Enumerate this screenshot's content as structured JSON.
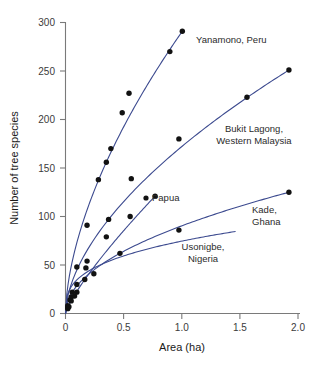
{
  "chart_data": {
    "type": "scatter",
    "title": "",
    "xlabel": "Area (ha)",
    "ylabel": "Number of tree species",
    "xlim": [
      0,
      2.05
    ],
    "ylim": [
      0,
      300
    ],
    "xticks": [
      0,
      0.5,
      1.0,
      1.5,
      2.0
    ],
    "xticklabels": [
      "0",
      "0.5",
      "1.0",
      "1.5",
      "2.0"
    ],
    "yticks": [
      0,
      50,
      100,
      150,
      200,
      250,
      300
    ],
    "yticklabels": [
      "0",
      "50",
      "100",
      "150",
      "200",
      "250",
      "300"
    ],
    "grid": false,
    "legend": "inline-annotations",
    "line_color": "#3c4a8f",
    "marker_color": "#121212",
    "series": [
      {
        "name": "Yanamono, Peru",
        "label": "Yanamono, Peru",
        "label_lines": [
          "Yanamono, Peru"
        ],
        "points": [
          {
            "x": 0.02,
            "y": 6
          },
          {
            "x": 0.04,
            "y": 14
          },
          {
            "x": 0.06,
            "y": 22
          },
          {
            "x": 0.1,
            "y": 48
          },
          {
            "x": 0.19,
            "y": 54
          },
          {
            "x": 0.29,
            "y": 138
          },
          {
            "x": 0.36,
            "y": 156
          },
          {
            "x": 0.4,
            "y": 170
          },
          {
            "x": 0.5,
            "y": 207
          },
          {
            "x": 0.56,
            "y": 227
          },
          {
            "x": 0.92,
            "y": 270
          },
          {
            "x": 1.03,
            "y": 291
          }
        ]
      },
      {
        "name": "Bukit Lagong, Western Malaysia",
        "label": "Bukit Lagong, Western Malaysia",
        "label_lines": [
          "Bukit Lagong,",
          "Western Malaysia"
        ],
        "points": [
          {
            "x": 0.02,
            "y": 8
          },
          {
            "x": 0.05,
            "y": 17
          },
          {
            "x": 0.1,
            "y": 30
          },
          {
            "x": 0.18,
            "y": 47
          },
          {
            "x": 0.19,
            "y": 91
          },
          {
            "x": 0.38,
            "y": 97
          },
          {
            "x": 0.58,
            "y": 139
          },
          {
            "x": 1.0,
            "y": 180
          },
          {
            "x": 1.6,
            "y": 223
          },
          {
            "x": 1.97,
            "y": 251
          }
        ]
      },
      {
        "name": "Papua",
        "label": "Papua",
        "label_lines": [
          "Papua"
        ],
        "points": [
          {
            "x": 0.02,
            "y": 5
          },
          {
            "x": 0.05,
            "y": 13
          },
          {
            "x": 0.1,
            "y": 22
          },
          {
            "x": 0.17,
            "y": 35
          },
          {
            "x": 0.36,
            "y": 79
          },
          {
            "x": 0.57,
            "y": 100
          },
          {
            "x": 0.79,
            "y": 121
          }
        ]
      },
      {
        "name": "Kade, Ghana",
        "label": "Kade, Ghana",
        "label_lines": [
          "Kade,",
          "Ghana"
        ],
        "points": [
          {
            "x": 0.03,
            "y": 7
          },
          {
            "x": 0.08,
            "y": 18
          },
          {
            "x": 0.25,
            "y": 41
          },
          {
            "x": 0.48,
            "y": 62
          },
          {
            "x": 1.0,
            "y": 86
          },
          {
            "x": 1.97,
            "y": 125
          }
        ]
      },
      {
        "name": "Usonigbe, Nigeria",
        "label": "Usonigbe, Nigeria",
        "label_lines": [
          "Usonigbe,",
          "Nigeria"
        ],
        "points": []
      }
    ],
    "annotations": [
      {
        "text": "Yanamono, Peru",
        "x": 1.12,
        "y": 286
      },
      {
        "text": "Bukit Lagong, Western Malaysia",
        "x": 1.28,
        "y": 152
      },
      {
        "text": "Papua",
        "x": 0.88,
        "y": 121
      },
      {
        "text": "Kade, Ghana",
        "x": 1.6,
        "y": 108
      },
      {
        "text": "Usonigbe, Nigeria",
        "x": 1.05,
        "y": 62
      }
    ]
  }
}
